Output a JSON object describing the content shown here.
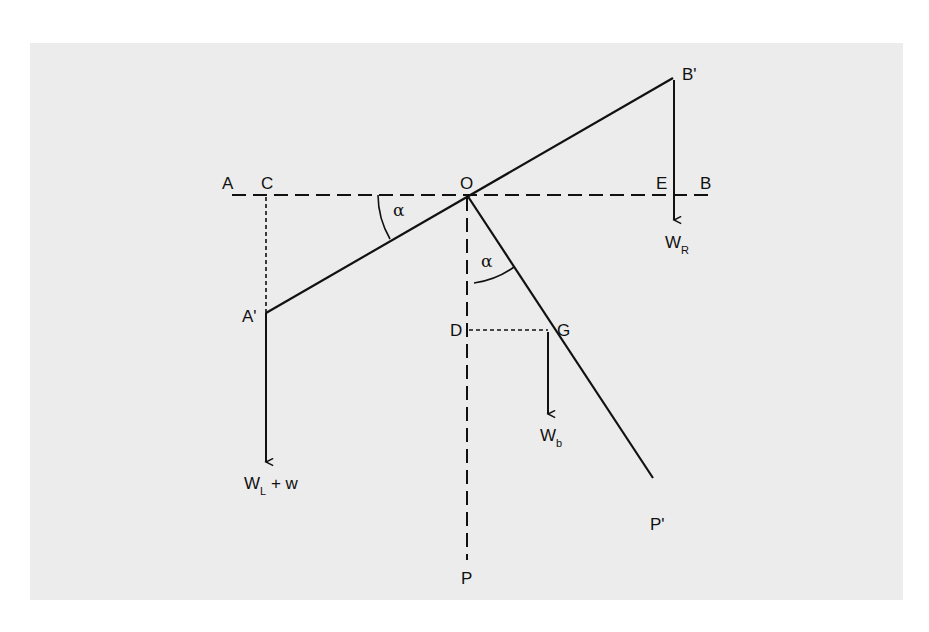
{
  "diagram": {
    "points": {
      "A": "A",
      "C": "C",
      "O": "O",
      "E": "E",
      "B": "B",
      "A_prime": "A'",
      "B_prime": "B'",
      "D": "D",
      "G": "G",
      "P": "P",
      "P_prime": "P'"
    },
    "angles": {
      "alpha_top": "α",
      "alpha_bottom": "α"
    },
    "forces": {
      "left": {
        "main": "W",
        "sub": "L",
        "suffix": " + w"
      },
      "right": {
        "main": "W",
        "sub": "R"
      },
      "beam": {
        "main": "W",
        "sub": "b"
      }
    },
    "colors": {
      "background": "#ffffff",
      "panel": "#ececec",
      "ink": "#111111"
    }
  }
}
